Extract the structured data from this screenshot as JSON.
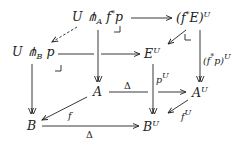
{
  "diagram": {
    "type": "commutative-cube",
    "nodes": {
      "U_pitchfork_A_fstar_p": {
        "base": "U ⋔",
        "sub": "A",
        "rest": " f",
        "sup": "*",
        "tail": "p"
      },
      "fstarE_U": {
        "base": "(f",
        "sup1": "*",
        "mid": "E)",
        "sup": "U"
      },
      "U_pitchfork_B_p": {
        "base": "U ⋔",
        "sub": "B",
        "tail": " p"
      },
      "E_U": {
        "base": "E",
        "sup": "U"
      },
      "A": {
        "base": "A"
      },
      "A_U": {
        "base": "A",
        "sup": "U"
      },
      "B": {
        "base": "B"
      },
      "B_U": {
        "base": "B",
        "sup": "U"
      }
    },
    "labels": {
      "fstarp_U": {
        "base": "(f",
        "sup1": "*",
        "mid": "p)",
        "sup": "U"
      },
      "p_U": {
        "base": "p",
        "sup": "U"
      },
      "delta_top": "Δ",
      "delta_bottom": "Δ",
      "f": "f",
      "f_U": {
        "base": "f",
        "sup": "U"
      }
    },
    "pullback_corners": [
      "⌟",
      "⌟",
      "⌞"
    ],
    "arrows": [
      {
        "from": "U ⋔_A f*p",
        "to": "(f*E)^U",
        "style": "solid"
      },
      {
        "from": "U ⋔_A f*p",
        "to": "U ⋔_B p",
        "style": "dashed"
      },
      {
        "from": "U ⋔_A f*p",
        "to": "A",
        "style": "fibration"
      },
      {
        "from": "(f*E)^U",
        "to": "E^U",
        "style": "solid"
      },
      {
        "from": "(f*E)^U",
        "to": "A^U",
        "style": "fibration",
        "label": "(f*p)^U"
      },
      {
        "from": "U ⋔_B p",
        "to": "E^U",
        "style": "solid"
      },
      {
        "from": "U ⋔_B p",
        "to": "B",
        "style": "fibration"
      },
      {
        "from": "E^U",
        "to": "B^U",
        "style": "fibration",
        "label": "p^U"
      },
      {
        "from": "A",
        "to": "A^U",
        "style": "solid",
        "label": "Δ"
      },
      {
        "from": "A",
        "to": "B",
        "style": "solid",
        "label": "f"
      },
      {
        "from": "A^U",
        "to": "B^U",
        "style": "solid",
        "label": "f^U"
      },
      {
        "from": "B",
        "to": "B^U",
        "style": "solid",
        "label": "Δ"
      }
    ]
  }
}
